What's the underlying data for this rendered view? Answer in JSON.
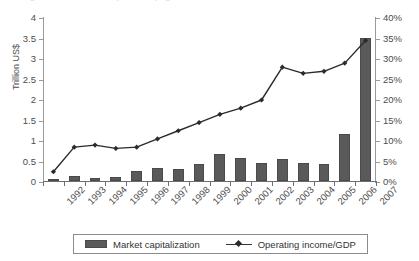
{
  "top_cutoff_text": "Figure continued from previous page",
  "chart_data": {
    "type": "bar",
    "title": "",
    "subtitle": "",
    "xlabel": "",
    "ylabel": "Trillion US$",
    "ylabel_secondary": "",
    "categories": [
      "1992",
      "1993",
      "1994",
      "1995",
      "1996",
      "1997",
      "1998",
      "1999",
      "2000",
      "2001",
      "2002",
      "2003",
      "2004",
      "2005",
      "2006",
      "2007"
    ],
    "ylim": [
      0,
      4
    ],
    "yticks": [
      0,
      0.5,
      1,
      1.5,
      2,
      2.5,
      3,
      3.5,
      4
    ],
    "ytick_labels": [
      "0",
      "0.5",
      "1",
      "1.5",
      "2",
      "2.5",
      "3",
      "3.5",
      "4"
    ],
    "ylim_secondary": [
      0,
      40
    ],
    "yticks_secondary": [
      0,
      5,
      10,
      15,
      20,
      25,
      30,
      35,
      40
    ],
    "ytick_labels_secondary": [
      "0%",
      "5%",
      "10%",
      "15%",
      "20%",
      "25%",
      "30%",
      "35%",
      "40%"
    ],
    "grid": false,
    "legend_position": "bottom",
    "series": [
      {
        "name": "Market capitalization",
        "type": "bar",
        "axis": "left",
        "unit": "Trillion US$",
        "color": "#5a5a5a",
        "values": [
          0.04,
          0.12,
          0.08,
          0.1,
          0.25,
          0.32,
          0.3,
          0.42,
          0.65,
          0.55,
          0.43,
          0.53,
          0.45,
          0.42,
          1.15,
          3.5
        ]
      },
      {
        "name": "Operating income/GDP",
        "type": "line",
        "axis": "right",
        "unit": "%",
        "color": "#2b2b2b",
        "marker": "diamond",
        "values": [
          2.5,
          8.5,
          9.0,
          8.2,
          8.5,
          10.5,
          12.5,
          14.5,
          16.5,
          18.0,
          20.0,
          28.0,
          26.5,
          27.0,
          29.0,
          34.5
        ]
      }
    ]
  },
  "legend": {
    "entries": [
      {
        "label": "Market capitalization",
        "icon": "bar-swatch-icon"
      },
      {
        "label": "Operating income/GDP",
        "icon": "line-marker-swatch-icon"
      }
    ]
  }
}
